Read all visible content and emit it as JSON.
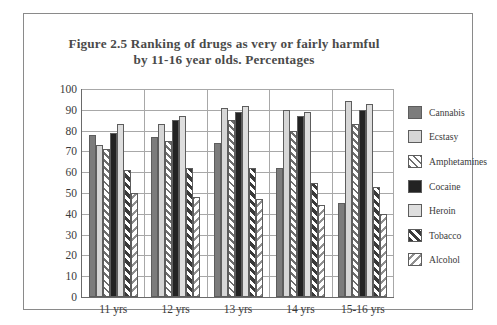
{
  "chart_data": {
    "type": "bar",
    "title": "Figure 2.5 Ranking of drugs as very or fairly harmful by 11-16 year olds. Percentages",
    "title_lines": [
      "Figure 2.5 Ranking of drugs as very or fairly harmful",
      "by 11-16 year olds. Percentages"
    ],
    "xlabel": "",
    "ylabel": "",
    "ylim": [
      0,
      100
    ],
    "ytick_step": 10,
    "grid": true,
    "legend_position": "right",
    "categories": [
      "11 yrs",
      "12 yrs",
      "13 yrs",
      "14 yrs",
      "15-16 yrs"
    ],
    "yticks": [
      "100",
      "90",
      "80",
      "70",
      "60",
      "50",
      "40",
      "30",
      "20",
      "10",
      "0"
    ],
    "series": [
      {
        "name": "Cannabis",
        "pattern": "solid-medium-gray",
        "color": "#7c7c7c",
        "values": [
          78,
          77,
          74,
          62,
          45
        ]
      },
      {
        "name": "Ecstasy",
        "pattern": "solid-light-gray",
        "color": "#d6d6d6",
        "values": [
          73,
          83,
          91,
          90,
          94
        ]
      },
      {
        "name": "Amphetamines",
        "pattern": "diagonal-stripes-up",
        "color": "#e8e8e8",
        "values": [
          71,
          75,
          85,
          80,
          83
        ]
      },
      {
        "name": "Cocaine",
        "pattern": "solid-black",
        "color": "#232323",
        "values": [
          79,
          85,
          89,
          87,
          90
        ]
      },
      {
        "name": "Heroin",
        "pattern": "solid-pale-gray",
        "color": "#dedede",
        "values": [
          83,
          87,
          92,
          89,
          93
        ]
      },
      {
        "name": "Tobacco",
        "pattern": "bold-diagonal-up",
        "color": "#3a3a3a",
        "values": [
          61,
          62,
          62,
          55,
          53
        ]
      },
      {
        "name": "Alcohol",
        "pattern": "diagonal-stripes-down",
        "color": "#8f8f8f",
        "values": [
          50,
          48,
          47,
          44,
          40
        ]
      }
    ]
  }
}
